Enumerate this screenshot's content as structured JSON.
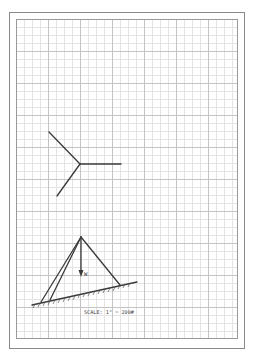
{
  "diagram": {
    "force_label": "W",
    "scale_text": "SCALE: 1\" = 200#"
  },
  "colors": {
    "ink": "#3a3a3a",
    "grid_minor": "#e4e4e4",
    "grid_major": "#c4c4c4",
    "frame": "#8a8a8a"
  }
}
